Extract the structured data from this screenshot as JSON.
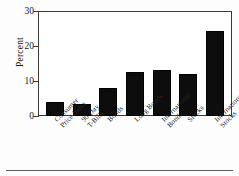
{
  "chart_data": {
    "type": "bar",
    "title": "",
    "xlabel": "",
    "ylabel": "Percent",
    "ylim": [
      0,
      30
    ],
    "yticks": [
      0,
      10,
      20,
      30
    ],
    "ytick_labels": [
      "0",
      "10",
      "20",
      "30"
    ],
    "grid": false,
    "legend": false,
    "bar_color": "#0d0d0d",
    "categories": [
      "Consumer\nPrice Index",
      "90 Day\nT-Bills",
      "Bonds",
      "Long Bonds",
      "International\nBonds",
      "Stocks",
      "International\nStocks"
    ],
    "values": [
      4.0,
      3.4,
      8.1,
      12.8,
      13.4,
      12.1,
      24.6
    ]
  },
  "figure": {
    "axis_color": "#3a3a3a",
    "background": "#ffffff",
    "rule_color": "#5d5d5d"
  }
}
